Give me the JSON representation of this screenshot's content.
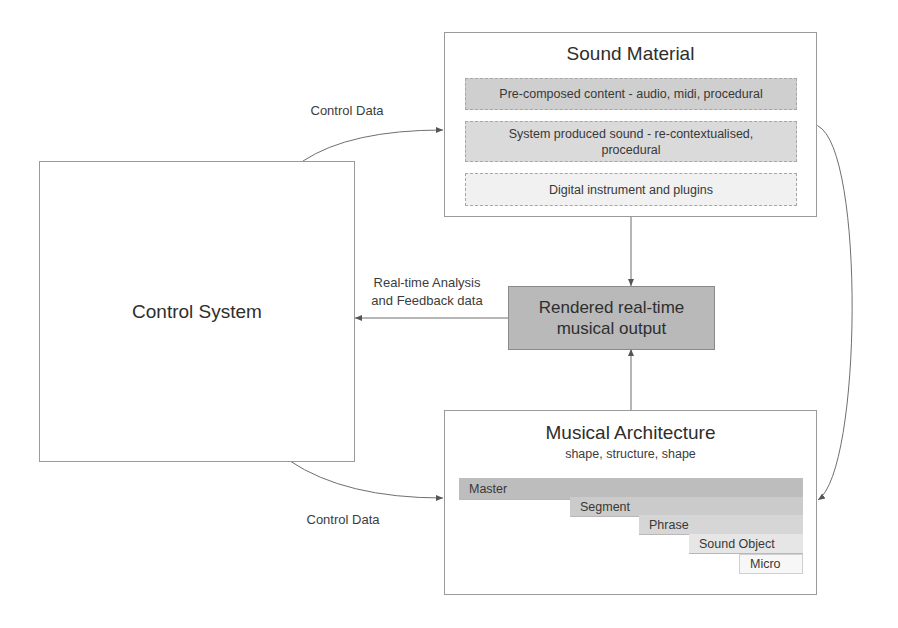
{
  "control_system": {
    "title": "Control System"
  },
  "sound_material": {
    "title": "Sound Material",
    "items": [
      {
        "label": "Pre-composed content - audio, midi, procedural",
        "fill": "#cfcfcf"
      },
      {
        "label": "System produced sound - re-contextualised, procedural",
        "fill": "#dadada"
      },
      {
        "label": "Digital instrument and plugins",
        "fill": "#f1f1f1"
      }
    ]
  },
  "rendered_output": {
    "title": "Rendered real-time musical output",
    "fill": "#b9b9b9"
  },
  "musical_architecture": {
    "title": "Musical Architecture",
    "subtitle": "shape, structure, shape",
    "levels": [
      {
        "label": "Master",
        "fill": "#bdbdbd"
      },
      {
        "label": "Segment",
        "fill": "#cbcbcb"
      },
      {
        "label": "Phrase",
        "fill": "#d6d6d6"
      },
      {
        "label": "Sound Object",
        "fill": "#e6e6e6"
      },
      {
        "label": "Micro",
        "fill": "#f7f7f7"
      }
    ]
  },
  "edges": {
    "control_data_top": "Control Data",
    "control_data_bottom": "Control Data",
    "feedback": "Real-time Analysis and Feedback data"
  },
  "colors": {
    "line": "#6f6f6f",
    "border": "#9a9a9a"
  }
}
